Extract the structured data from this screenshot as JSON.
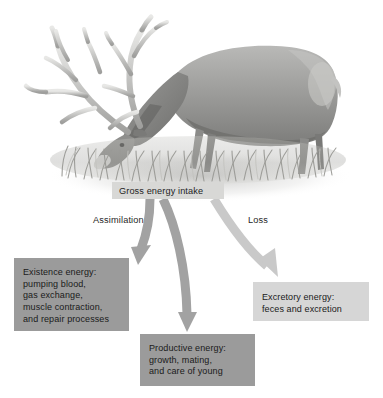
{
  "figure": {
    "illustration": {
      "name": "grazing-elk-illustration",
      "subject": "bull elk with large antlers grazing in grass",
      "style": "grayscale airbrush illustration"
    },
    "source_label": {
      "text": "Gross energy intake",
      "box_color": "#d8d8d6"
    },
    "flow_labels": [
      {
        "id": "assimilation",
        "text": "Assimilation"
      },
      {
        "id": "loss",
        "text": "Loss"
      }
    ],
    "outcomes": [
      {
        "id": "existence",
        "box_color": "#9b9b9b",
        "lines": [
          "Existence energy:",
          "pumping blood,",
          "gas exchange,",
          "muscle contraction,",
          "and repair processes"
        ]
      },
      {
        "id": "productive",
        "box_color": "#9b9b9b",
        "lines": [
          "Productive energy:",
          "growth, mating,",
          "and care of young"
        ]
      },
      {
        "id": "excretory",
        "box_color": "#d6d6d6",
        "lines": [
          "Excretory energy:",
          "feces and excretion"
        ]
      }
    ],
    "arrows": [
      {
        "id": "arrow-assimilation-left",
        "from": "Gross energy intake",
        "to": "Existence energy",
        "color": "#a2a2a2"
      },
      {
        "id": "arrow-assimilation-middle",
        "from": "Gross energy intake",
        "to": "Productive energy",
        "color": "#a2a2a2"
      },
      {
        "id": "arrow-loss-right",
        "from": "Gross energy intake",
        "to": "Excretory energy",
        "color": "#c9c9c9"
      }
    ],
    "colors": {
      "background": "#ffffff",
      "text": "#1f1f1f",
      "dark_box": "#9b9b9b",
      "light_box": "#d6d6d6",
      "arrow_dark": "#a2a2a2",
      "arrow_light": "#c9c9c9"
    }
  }
}
